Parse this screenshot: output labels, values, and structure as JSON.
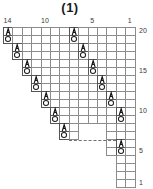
{
  "chart": {
    "title": "(1)",
    "type": "knitting-stitch-chart",
    "grid": {
      "columns": 14,
      "rows": 20,
      "column_numbering_direction": "right-to-left",
      "row_numbering_direction": "bottom-to-top",
      "cell_width_px": 9.4,
      "cell_height_px": 8.0
    },
    "column_labels": [
      {
        "text": "14",
        "column": 14
      },
      {
        "text": "10",
        "column": 10
      },
      {
        "text": "5",
        "column": 5
      },
      {
        "text": "1",
        "column": 1
      }
    ],
    "row_labels": [
      {
        "text": "20",
        "row": 20
      },
      {
        "text": "15",
        "row": 15
      },
      {
        "text": "10",
        "row": 10
      },
      {
        "text": "5",
        "row": 5
      },
      {
        "text": "1",
        "row": 1
      }
    ],
    "legend_symbols": [
      {
        "name": "yarn-over-symbol",
        "glyph": "O",
        "meaning": "yarn over"
      },
      {
        "name": "decrease-symbol",
        "glyph": "A",
        "meaning": "decrease"
      }
    ],
    "outline_cells": [
      {
        "col": 14,
        "row": 20
      },
      {
        "col": 13,
        "row": 20
      },
      {
        "col": 12,
        "row": 20
      },
      {
        "col": 11,
        "row": 20
      },
      {
        "col": 10,
        "row": 20
      },
      {
        "col": 9,
        "row": 20
      },
      {
        "col": 8,
        "row": 20
      },
      {
        "col": 7,
        "row": 20
      },
      {
        "col": 6,
        "row": 20
      },
      {
        "col": 5,
        "row": 20
      },
      {
        "col": 4,
        "row": 20
      },
      {
        "col": 3,
        "row": 20
      },
      {
        "col": 2,
        "row": 20
      },
      {
        "col": 1,
        "row": 20
      },
      {
        "col": 14,
        "row": 19
      },
      {
        "col": 13,
        "row": 19
      },
      {
        "col": 12,
        "row": 19
      },
      {
        "col": 11,
        "row": 19
      },
      {
        "col": 10,
        "row": 19
      },
      {
        "col": 9,
        "row": 19
      },
      {
        "col": 8,
        "row": 19
      },
      {
        "col": 7,
        "row": 19
      },
      {
        "col": 6,
        "row": 19
      },
      {
        "col": 5,
        "row": 19
      },
      {
        "col": 4,
        "row": 19
      },
      {
        "col": 3,
        "row": 19
      },
      {
        "col": 2,
        "row": 19
      },
      {
        "col": 1,
        "row": 19
      },
      {
        "col": 13,
        "row": 18
      },
      {
        "col": 12,
        "row": 18
      },
      {
        "col": 11,
        "row": 18
      },
      {
        "col": 10,
        "row": 18
      },
      {
        "col": 9,
        "row": 18
      },
      {
        "col": 8,
        "row": 18
      },
      {
        "col": 7,
        "row": 18
      },
      {
        "col": 6,
        "row": 18
      },
      {
        "col": 5,
        "row": 18
      },
      {
        "col": 4,
        "row": 18
      },
      {
        "col": 3,
        "row": 18
      },
      {
        "col": 2,
        "row": 18
      },
      {
        "col": 1,
        "row": 18
      },
      {
        "col": 13,
        "row": 17
      },
      {
        "col": 12,
        "row": 17
      },
      {
        "col": 11,
        "row": 17
      },
      {
        "col": 10,
        "row": 17
      },
      {
        "col": 9,
        "row": 17
      },
      {
        "col": 8,
        "row": 17
      },
      {
        "col": 7,
        "row": 17
      },
      {
        "col": 6,
        "row": 17
      },
      {
        "col": 5,
        "row": 17
      },
      {
        "col": 4,
        "row": 17
      },
      {
        "col": 3,
        "row": 17
      },
      {
        "col": 2,
        "row": 17
      },
      {
        "col": 1,
        "row": 17
      },
      {
        "col": 12,
        "row": 16
      },
      {
        "col": 11,
        "row": 16
      },
      {
        "col": 10,
        "row": 16
      },
      {
        "col": 9,
        "row": 16
      },
      {
        "col": 8,
        "row": 16
      },
      {
        "col": 7,
        "row": 16
      },
      {
        "col": 6,
        "row": 16
      },
      {
        "col": 5,
        "row": 16
      },
      {
        "col": 4,
        "row": 16
      },
      {
        "col": 3,
        "row": 16
      },
      {
        "col": 2,
        "row": 16
      },
      {
        "col": 1,
        "row": 16
      },
      {
        "col": 12,
        "row": 15
      },
      {
        "col": 11,
        "row": 15
      },
      {
        "col": 10,
        "row": 15
      },
      {
        "col": 9,
        "row": 15
      },
      {
        "col": 8,
        "row": 15
      },
      {
        "col": 7,
        "row": 15
      },
      {
        "col": 6,
        "row": 15
      },
      {
        "col": 5,
        "row": 15
      },
      {
        "col": 4,
        "row": 15
      },
      {
        "col": 3,
        "row": 15
      },
      {
        "col": 2,
        "row": 15
      },
      {
        "col": 1,
        "row": 15
      },
      {
        "col": 11,
        "row": 14
      },
      {
        "col": 10,
        "row": 14
      },
      {
        "col": 9,
        "row": 14
      },
      {
        "col": 8,
        "row": 14
      },
      {
        "col": 7,
        "row": 14
      },
      {
        "col": 6,
        "row": 14
      },
      {
        "col": 5,
        "row": 14
      },
      {
        "col": 4,
        "row": 14
      },
      {
        "col": 3,
        "row": 14
      },
      {
        "col": 2,
        "row": 14
      },
      {
        "col": 1,
        "row": 14
      },
      {
        "col": 11,
        "row": 13
      },
      {
        "col": 10,
        "row": 13
      },
      {
        "col": 9,
        "row": 13
      },
      {
        "col": 8,
        "row": 13
      },
      {
        "col": 7,
        "row": 13
      },
      {
        "col": 6,
        "row": 13
      },
      {
        "col": 5,
        "row": 13
      },
      {
        "col": 4,
        "row": 13
      },
      {
        "col": 3,
        "row": 13
      },
      {
        "col": 2,
        "row": 13
      },
      {
        "col": 1,
        "row": 13
      },
      {
        "col": 10,
        "row": 12
      },
      {
        "col": 9,
        "row": 12
      },
      {
        "col": 8,
        "row": 12
      },
      {
        "col": 7,
        "row": 12
      },
      {
        "col": 6,
        "row": 12
      },
      {
        "col": 5,
        "row": 12
      },
      {
        "col": 4,
        "row": 12
      },
      {
        "col": 3,
        "row": 12
      },
      {
        "col": 2,
        "row": 12
      },
      {
        "col": 1,
        "row": 12
      },
      {
        "col": 10,
        "row": 11
      },
      {
        "col": 9,
        "row": 11
      },
      {
        "col": 8,
        "row": 11
      },
      {
        "col": 7,
        "row": 11
      },
      {
        "col": 6,
        "row": 11
      },
      {
        "col": 5,
        "row": 11
      },
      {
        "col": 4,
        "row": 11
      },
      {
        "col": 3,
        "row": 11
      },
      {
        "col": 2,
        "row": 11
      },
      {
        "col": 1,
        "row": 11
      },
      {
        "col": 9,
        "row": 10
      },
      {
        "col": 8,
        "row": 10
      },
      {
        "col": 7,
        "row": 10
      },
      {
        "col": 6,
        "row": 10
      },
      {
        "col": 5,
        "row": 10
      },
      {
        "col": 4,
        "row": 10
      },
      {
        "col": 3,
        "row": 10
      },
      {
        "col": 2,
        "row": 10
      },
      {
        "col": 1,
        "row": 10
      },
      {
        "col": 9,
        "row": 9
      },
      {
        "col": 8,
        "row": 9
      },
      {
        "col": 7,
        "row": 9
      },
      {
        "col": 6,
        "row": 9
      },
      {
        "col": 5,
        "row": 9
      },
      {
        "col": 4,
        "row": 9
      },
      {
        "col": 3,
        "row": 9
      },
      {
        "col": 2,
        "row": 9
      },
      {
        "col": 1,
        "row": 9
      },
      {
        "col": 8,
        "row": 8
      },
      {
        "col": 7,
        "row": 8
      },
      {
        "col": 3,
        "row": 8
      },
      {
        "col": 2,
        "row": 8
      },
      {
        "col": 1,
        "row": 8
      },
      {
        "col": 8,
        "row": 7
      },
      {
        "col": 7,
        "row": 7
      },
      {
        "col": 3,
        "row": 7
      },
      {
        "col": 2,
        "row": 7
      },
      {
        "col": 1,
        "row": 7
      },
      {
        "col": 3,
        "row": 6
      },
      {
        "col": 2,
        "row": 6
      },
      {
        "col": 1,
        "row": 6
      },
      {
        "col": 3,
        "row": 5
      },
      {
        "col": 2,
        "row": 5
      },
      {
        "col": 1,
        "row": 5
      },
      {
        "col": 2,
        "row": 4
      },
      {
        "col": 1,
        "row": 4
      },
      {
        "col": 2,
        "row": 3
      },
      {
        "col": 1,
        "row": 3
      },
      {
        "col": 2,
        "row": 2
      },
      {
        "col": 1,
        "row": 2
      },
      {
        "col": 2,
        "row": 1
      },
      {
        "col": 1,
        "row": 1
      }
    ],
    "symbols": [
      {
        "col": 14,
        "row": 20,
        "type": "decrease",
        "glyph": "A"
      },
      {
        "col": 14,
        "row": 19,
        "type": "yarn-over",
        "glyph": "O"
      },
      {
        "col": 13,
        "row": 18,
        "type": "decrease",
        "glyph": "A"
      },
      {
        "col": 13,
        "row": 17,
        "type": "yarn-over",
        "glyph": "O"
      },
      {
        "col": 12,
        "row": 16,
        "type": "decrease",
        "glyph": "A"
      },
      {
        "col": 12,
        "row": 15,
        "type": "yarn-over",
        "glyph": "O"
      },
      {
        "col": 11,
        "row": 14,
        "type": "decrease",
        "glyph": "A"
      },
      {
        "col": 11,
        "row": 13,
        "type": "yarn-over",
        "glyph": "O"
      },
      {
        "col": 10,
        "row": 12,
        "type": "decrease",
        "glyph": "A"
      },
      {
        "col": 10,
        "row": 11,
        "type": "yarn-over",
        "glyph": "O"
      },
      {
        "col": 9,
        "row": 10,
        "type": "decrease",
        "glyph": "A"
      },
      {
        "col": 9,
        "row": 9,
        "type": "yarn-over",
        "glyph": "O"
      },
      {
        "col": 8,
        "row": 8,
        "type": "decrease",
        "glyph": "A"
      },
      {
        "col": 8,
        "row": 7,
        "type": "yarn-over",
        "glyph": "O"
      },
      {
        "col": 7,
        "row": 20,
        "type": "decrease",
        "glyph": "A"
      },
      {
        "col": 7,
        "row": 19,
        "type": "yarn-over",
        "glyph": "O"
      },
      {
        "col": 6,
        "row": 18,
        "type": "decrease",
        "glyph": "A"
      },
      {
        "col": 6,
        "row": 17,
        "type": "yarn-over",
        "glyph": "O"
      },
      {
        "col": 5,
        "row": 16,
        "type": "decrease",
        "glyph": "A"
      },
      {
        "col": 5,
        "row": 15,
        "type": "yarn-over",
        "glyph": "O"
      },
      {
        "col": 4,
        "row": 14,
        "type": "decrease",
        "glyph": "A"
      },
      {
        "col": 4,
        "row": 13,
        "type": "yarn-over",
        "glyph": "O"
      },
      {
        "col": 3,
        "row": 12,
        "type": "decrease",
        "glyph": "A"
      },
      {
        "col": 3,
        "row": 11,
        "type": "yarn-over",
        "glyph": "O"
      },
      {
        "col": 2,
        "row": 10,
        "type": "decrease",
        "glyph": "A"
      },
      {
        "col": 2,
        "row": 9,
        "type": "yarn-over",
        "glyph": "O"
      },
      {
        "col": 2,
        "row": 6,
        "type": "decrease",
        "glyph": "A"
      },
      {
        "col": 2,
        "row": 5,
        "type": "yarn-over",
        "glyph": "O"
      }
    ],
    "dashed_connector": {
      "name": "repeat-connector",
      "from_col": 7,
      "to_col": 3,
      "row": 7,
      "style": "dashed"
    }
  }
}
